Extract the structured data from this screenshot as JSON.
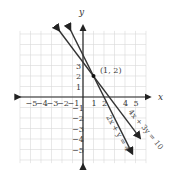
{
  "chart_data": {
    "type": "line",
    "title": "",
    "xlabel": "x",
    "ylabel": "y",
    "xlim": [
      -6,
      6
    ],
    "ylim": [
      -6,
      6
    ],
    "grid": true,
    "x_ticks": [
      "-5",
      "-4",
      "-3",
      "-2",
      "-1",
      "1",
      "2",
      "4",
      "5"
    ],
    "y_ticks": [
      "3",
      "2",
      "1",
      "-1",
      "-2",
      "-3",
      "-4",
      "-5"
    ],
    "series": [
      {
        "name": "4x + 3y = 10",
        "slope": -1.3333,
        "intercept": 3.3333,
        "x": [
          -2.4,
          5.3
        ],
        "y": [
          6.5,
          -3.73
        ]
      },
      {
        "name": "2x + y = 4",
        "slope": -2,
        "intercept": 4,
        "x": [
          -1.3,
          4.6
        ],
        "y": [
          6.6,
          -5.2
        ]
      }
    ],
    "annotations": [
      {
        "text": "(1, 2)",
        "x": 1,
        "y": 2,
        "type": "point"
      }
    ]
  },
  "labels": {
    "x_axis": "x",
    "y_axis": "y",
    "point": "(1, 2)",
    "line1": "4x + 3y = 10",
    "line2": "2x + y = 4"
  }
}
